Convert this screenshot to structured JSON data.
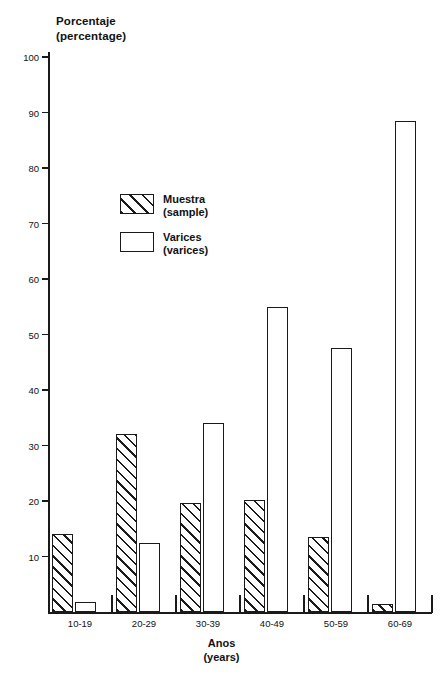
{
  "chart_data": {
    "type": "bar",
    "title": "",
    "ylabel": "Porcentaje",
    "ylabel_translation": "(percentage)",
    "xlabel": "Anos",
    "xlabel_translation": "(years)",
    "categories": [
      "10-19",
      "20-29",
      "30-39",
      "40-49",
      "50-59",
      "60-69"
    ],
    "ylim": [
      0,
      100
    ],
    "yticks": [
      10,
      20,
      30,
      40,
      50,
      60,
      70,
      80,
      90,
      100
    ],
    "ytick_labels": [
      "10",
      "20",
      "30",
      "40",
      "50",
      "60",
      "70",
      "80",
      "90",
      "100"
    ],
    "grid": false,
    "legend_position": "inside-upper-left",
    "series": [
      {
        "name": "Muestra",
        "name_translation": "(sample)",
        "pattern": "diagonal-hatch",
        "values": [
          14,
          32,
          19.7,
          20.2,
          13.5,
          1.5
        ]
      },
      {
        "name": "Varices",
        "name_translation": "(varices)",
        "pattern": "open",
        "values": [
          1.8,
          12.4,
          34,
          55,
          47.5,
          88.5
        ]
      }
    ]
  },
  "colors": {
    "ink": "#1a1a1a",
    "background": "#ffffff"
  }
}
